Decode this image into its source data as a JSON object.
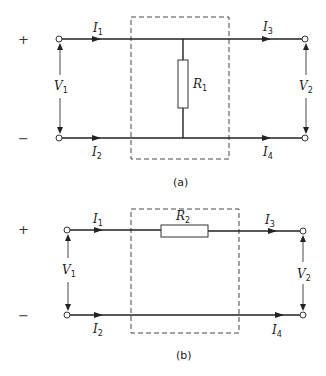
{
  "diagrams": [
    {
      "caption": "(a)",
      "plus": "+",
      "minus": "−",
      "currents": [
        {
          "base": "I",
          "sub": "1"
        },
        {
          "base": "I",
          "sub": "2"
        },
        {
          "base": "I",
          "sub": "3"
        },
        {
          "base": "I",
          "sub": "4"
        }
      ],
      "voltages": [
        {
          "base": "V",
          "sub": "1"
        },
        {
          "base": "V",
          "sub": "2"
        }
      ],
      "resistor": {
        "base": "R",
        "sub": "1",
        "orientation": "shunt"
      }
    },
    {
      "caption": "(b)",
      "plus": "+",
      "minus": "−",
      "currents": [
        {
          "base": "I",
          "sub": "1"
        },
        {
          "base": "I",
          "sub": "2"
        },
        {
          "base": "I",
          "sub": "3"
        },
        {
          "base": "I",
          "sub": "4"
        }
      ],
      "voltages": [
        {
          "base": "V",
          "sub": "1"
        },
        {
          "base": "V",
          "sub": "2"
        }
      ],
      "resistor": {
        "base": "R",
        "sub": "2",
        "orientation": "series"
      }
    }
  ]
}
